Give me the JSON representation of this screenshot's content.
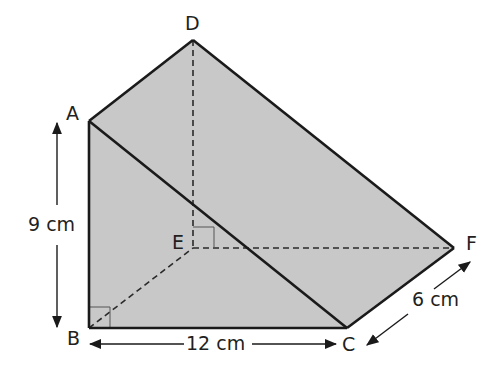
{
  "diagram": {
    "type": "triangular-prism",
    "fill_color": "#c8c8c8",
    "line_color": "#1a1a1a",
    "vertices": {
      "A": {
        "label": "A",
        "x": 89,
        "y": 121
      },
      "B": {
        "label": "B",
        "x": 89,
        "y": 328
      },
      "C": {
        "label": "C",
        "x": 347,
        "y": 328
      },
      "D": {
        "label": "D",
        "x": 193,
        "y": 40
      },
      "E": {
        "label": "E",
        "x": 193,
        "y": 248
      },
      "F": {
        "label": "F",
        "x": 454,
        "y": 248
      }
    },
    "dimensions": {
      "height": "9 cm",
      "base": "12 cm",
      "depth": "6 cm"
    },
    "right_angles": [
      "B",
      "E"
    ],
    "hidden_edges": [
      "BE",
      "DE",
      "EF"
    ],
    "visible_edges": [
      "AB",
      "BC",
      "AC",
      "AD",
      "DF",
      "CF"
    ]
  }
}
